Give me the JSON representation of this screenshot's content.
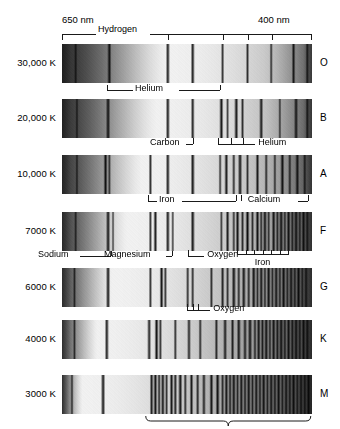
{
  "figure": {
    "wavelength_left": "650 nm",
    "wavelength_right": "400 nm"
  },
  "chart_data": {
    "type": "heatmap",
    "xlabel": "Wavelength",
    "ylabel": "Surface temperature",
    "xlim": [
      650,
      400
    ],
    "x_tick_labels": [
      "650 nm",
      "400 nm"
    ],
    "grid": false,
    "legend": "none",
    "categories": [
      "30,000 K",
      "20,000 K",
      "10,000 K",
      "7000 K",
      "6000 K",
      "4000 K",
      "3000 K"
    ],
    "series": [
      {
        "name": "O",
        "temperature": "30,000 K",
        "spectral_class": "O",
        "absorption_lines": [
          0.055,
          0.19,
          0.425,
          0.525,
          0.645,
          0.745,
          0.84,
          0.93,
          0.985
        ],
        "line_strengths": [
          0.55,
          0.85,
          0.8,
          0.8,
          0.6,
          0.6,
          0.55,
          0.75,
          0.6
        ],
        "continuum_peak": 0.42
      },
      {
        "name": "B",
        "temperature": "20,000 K",
        "spectral_class": "B",
        "absorption_lines": [
          0.06,
          0.185,
          0.425,
          0.525,
          0.64,
          0.665,
          0.7,
          0.725,
          0.8,
          0.875,
          0.94,
          0.985
        ],
        "line_strengths": [
          0.5,
          0.9,
          0.8,
          0.75,
          0.85,
          0.5,
          0.85,
          0.6,
          0.8,
          0.5,
          0.8,
          0.6
        ],
        "continuum_peak": 0.38
      },
      {
        "name": "A",
        "temperature": "10,000 K",
        "spectral_class": "A",
        "absorption_lines": [
          0.06,
          0.175,
          0.19,
          0.355,
          0.425,
          0.525,
          0.635,
          0.66,
          0.69,
          0.715,
          0.745,
          0.785,
          0.82,
          0.855,
          0.885,
          0.915,
          0.945,
          0.975
        ],
        "line_strengths": [
          0.5,
          0.9,
          0.55,
          0.65,
          0.8,
          0.85,
          0.55,
          0.8,
          0.6,
          0.85,
          0.55,
          0.75,
          0.6,
          0.55,
          0.85,
          0.6,
          0.8,
          0.6
        ],
        "continuum_peak": 0.32
      },
      {
        "name": "F",
        "temperature": "7000 K",
        "spectral_class": "F",
        "absorption_lines": [
          0.055,
          0.185,
          0.205,
          0.355,
          0.375,
          0.425,
          0.445,
          0.525,
          0.64,
          0.665,
          0.69,
          0.705,
          0.725,
          0.745,
          0.765,
          0.785,
          0.8,
          0.815,
          0.83,
          0.85,
          0.865,
          0.88,
          0.895,
          0.91,
          0.925,
          0.94,
          0.955,
          0.97,
          0.985
        ],
        "line_strengths": [
          0.5,
          0.85,
          0.45,
          0.6,
          0.8,
          0.8,
          0.5,
          0.85,
          0.5,
          0.75,
          0.55,
          0.8,
          0.6,
          0.85,
          0.55,
          0.8,
          0.6,
          0.85,
          0.55,
          0.8,
          0.6,
          0.85,
          0.55,
          0.8,
          0.6,
          0.85,
          0.55,
          0.8,
          0.6
        ],
        "continuum_peak": 0.26
      },
      {
        "name": "G",
        "temperature": "6000 K",
        "spectral_class": "G",
        "absorption_lines": [
          0.05,
          0.185,
          0.355,
          0.4,
          0.415,
          0.505,
          0.525,
          0.6,
          0.645,
          0.665,
          0.69,
          0.71,
          0.73,
          0.75,
          0.77,
          0.785,
          0.8,
          0.815,
          0.83,
          0.845,
          0.86,
          0.875,
          0.89,
          0.905,
          0.92,
          0.935,
          0.95,
          0.965,
          0.98
        ],
        "line_strengths": [
          0.5,
          0.85,
          0.6,
          0.85,
          0.6,
          0.6,
          0.6,
          0.6,
          0.7,
          0.55,
          0.85,
          0.6,
          0.8,
          0.6,
          0.85,
          0.55,
          0.8,
          0.6,
          0.85,
          0.55,
          0.8,
          0.6,
          0.85,
          0.55,
          0.8,
          0.6,
          0.85,
          0.55,
          0.7
        ],
        "continuum_peak": 0.2
      },
      {
        "name": "K",
        "temperature": "4000 K",
        "spectral_class": "K",
        "absorption_lines": [
          0.05,
          0.18,
          0.35,
          0.38,
          0.395,
          0.455,
          0.51,
          0.555,
          0.62,
          0.655,
          0.685,
          0.71,
          0.735,
          0.755,
          0.775,
          0.79,
          0.805,
          0.82,
          0.835,
          0.85,
          0.865,
          0.88,
          0.895,
          0.91,
          0.925,
          0.94,
          0.955,
          0.97,
          0.985
        ],
        "line_strengths": [
          0.5,
          0.8,
          0.75,
          0.9,
          0.6,
          0.6,
          0.7,
          0.6,
          0.65,
          0.75,
          0.7,
          0.8,
          0.7,
          0.85,
          0.6,
          0.8,
          0.7,
          0.85,
          0.6,
          0.8,
          0.7,
          0.9,
          0.65,
          0.8,
          0.7,
          0.85,
          0.65,
          0.8,
          0.7
        ],
        "continuum_peak": 0.14
      },
      {
        "name": "M",
        "temperature": "3000 K",
        "spectral_class": "M",
        "absorption_lines": [
          0.04,
          0.165,
          0.36,
          0.375,
          0.39,
          0.405,
          0.42,
          0.44,
          0.455,
          0.475,
          0.495,
          0.52,
          0.545,
          0.57,
          0.6,
          0.625,
          0.645,
          0.66,
          0.675,
          0.69,
          0.705,
          0.72,
          0.735,
          0.75,
          0.765,
          0.78,
          0.795,
          0.81,
          0.825,
          0.84,
          0.855,
          0.87,
          0.885,
          0.9,
          0.915,
          0.93,
          0.945,
          0.96,
          0.975,
          0.99
        ],
        "line_strengths": [
          0.55,
          0.85,
          0.8,
          0.9,
          0.7,
          0.85,
          0.6,
          0.8,
          0.7,
          0.85,
          0.6,
          0.75,
          0.65,
          0.7,
          0.8,
          0.85,
          0.6,
          0.8,
          0.7,
          0.85,
          0.6,
          0.8,
          0.7,
          0.85,
          0.6,
          0.8,
          0.7,
          0.85,
          0.6,
          0.8,
          0.7,
          0.85,
          0.6,
          0.8,
          0.7,
          0.85,
          0.6,
          0.8,
          0.7,
          0.8
        ],
        "continuum_peak": 0.08
      }
    ],
    "annotations": [
      {
        "label": "Hydrogen",
        "row": "O",
        "position": "above",
        "span": [
          0.03,
          0.99
        ]
      },
      {
        "label": "Helium",
        "row": "O",
        "position": "below",
        "span": [
          0.18,
          0.63
        ]
      },
      {
        "label": "Carbon",
        "row": "B",
        "position": "below",
        "span": [
          0.5,
          0.54
        ]
      },
      {
        "label": "Helium",
        "row": "B",
        "position": "below",
        "span": [
          0.62,
          0.73
        ]
      },
      {
        "label": "Iron",
        "row": "A",
        "position": "below",
        "span": [
          0.34,
          0.7
        ]
      },
      {
        "label": "Calcium",
        "row": "A",
        "position": "below",
        "span": [
          0.71,
          0.98
        ]
      },
      {
        "label": "Sodium",
        "row": "F",
        "position": "below",
        "span": [
          0.17,
          0.21
        ]
      },
      {
        "label": "Magnesium",
        "row": "F",
        "position": "below",
        "span": [
          0.355,
          0.45
        ]
      },
      {
        "label": "Oxygen",
        "row": "F",
        "position": "below",
        "span": [
          0.5,
          0.54
        ]
      },
      {
        "label": "Iron",
        "row": "F",
        "position": "below",
        "span": [
          0.7,
          0.9
        ]
      },
      {
        "label": "Oxygen",
        "row": "G",
        "position": "below",
        "span": [
          0.5,
          0.545
        ]
      },
      {
        "label": "Many molecules",
        "row": "M",
        "position": "below",
        "span": [
          0.34,
          0.99
        ]
      }
    ]
  },
  "rows": [
    {
      "temperature": "30,000 K",
      "spectral_class": "O"
    },
    {
      "temperature": "20,000 K",
      "spectral_class": "B"
    },
    {
      "temperature": "10,000 K",
      "spectral_class": "A"
    },
    {
      "temperature": "7000 K",
      "spectral_class": "F"
    },
    {
      "temperature": "6000 K",
      "spectral_class": "G"
    },
    {
      "temperature": "4000 K",
      "spectral_class": "K"
    },
    {
      "temperature": "3000 K",
      "spectral_class": "M"
    }
  ],
  "labels": {
    "hydrogen": "Hydrogen",
    "helium_o": "Helium",
    "carbon": "Carbon",
    "helium_b": "Helium",
    "iron_a": "Iron",
    "calcium": "Calcium",
    "sodium": "Sodium",
    "magnesium": "Magnesium",
    "oxygen_f": "Oxygen",
    "iron_f": "Iron",
    "oxygen_g": "Oxygen",
    "many_molecules": "Many molecules"
  },
  "colors": {
    "ink": "#1a1a1a",
    "background": "#ffffff",
    "spectrum_dark": "#111111",
    "spectrum_light": "#e8e6e2"
  }
}
